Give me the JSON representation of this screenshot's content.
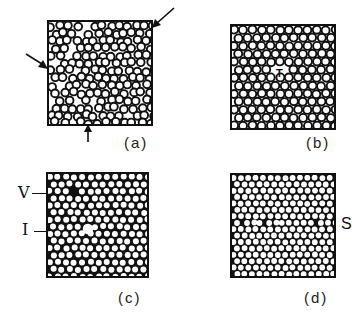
{
  "figure": {
    "panels": [
      {
        "id": "a",
        "label": "(a)",
        "style": "rings",
        "x": 47,
        "y": 20,
        "w": 106,
        "h": 106,
        "pitch": 8.6,
        "r": 3.9,
        "jitter": 1.6,
        "seed": 3
      },
      {
        "id": "b",
        "label": "(b)",
        "style": "rings",
        "x": 230,
        "y": 24,
        "w": 106,
        "h": 106,
        "pitch": 9.2,
        "r": 4.0,
        "jitter": 0.5,
        "seed": 7
      },
      {
        "id": "c",
        "label": "(c)",
        "style": "dots",
        "x": 46,
        "y": 172,
        "w": 103,
        "h": 106,
        "pitch": 8.2,
        "r": 3.0,
        "jitter": 0.6,
        "seed": 11
      },
      {
        "id": "d",
        "label": "(d)",
        "style": "dots",
        "x": 230,
        "y": 173,
        "w": 106,
        "h": 105,
        "pitch": 7.4,
        "r": 2.9,
        "jitter": 0.3,
        "seed": 19
      }
    ],
    "annotations": {
      "c_vacancy": "V",
      "c_interstitial": "I",
      "d_boundary": "S",
      "b_defect": "T"
    },
    "colors": {
      "ink": "#111111",
      "paper": "#ffffff"
    }
  }
}
